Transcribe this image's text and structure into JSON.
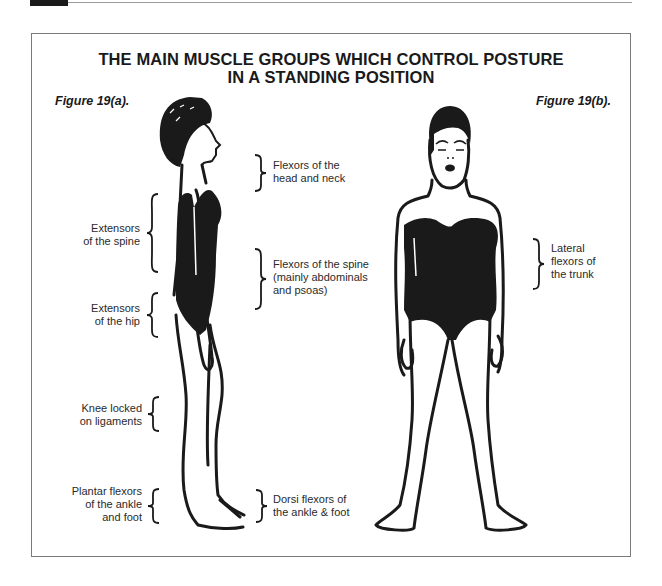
{
  "header": {
    "title_line1": "THE MAIN MUSCLE GROUPS WHICH CONTROL POSTURE",
    "title_line2": "IN A STANDING POSITION"
  },
  "figures": {
    "a": {
      "label": "Figure 19(a).",
      "view": "side",
      "annotations_left": [
        {
          "line1": "Extensors",
          "line2": "of the spine"
        },
        {
          "line1": "Extensors",
          "line2": "of the hip"
        },
        {
          "line1": "Knee locked",
          "line2": "on ligaments"
        },
        {
          "line1": "Plantar flexors",
          "line2": "of the ankle",
          "line3": "and foot"
        }
      ],
      "annotations_right": [
        {
          "line1": "Flexors of the",
          "line2": "head and neck"
        },
        {
          "line1": "Flexors of the spine",
          "line2": "(mainly abdominals",
          "line3": "and psoas)"
        },
        {
          "line1": "Dorsi flexors of",
          "line2": "the ankle & foot"
        }
      ]
    },
    "b": {
      "label": "Figure 19(b).",
      "view": "front",
      "annotations_right": [
        {
          "line1": "Lateral",
          "line2": "flexors of",
          "line3": "the trunk"
        }
      ]
    }
  },
  "colors": {
    "ink": "#1a1a1a",
    "frame": "#7a7a7a",
    "background": "#ffffff"
  }
}
